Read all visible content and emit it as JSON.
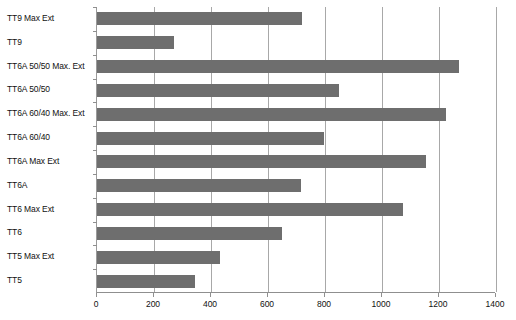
{
  "chart_data": {
    "type": "bar",
    "orientation": "horizontal",
    "title": "",
    "xlabel": "",
    "ylabel": "",
    "xlim": [
      0,
      1400
    ],
    "xticks": [
      0,
      200,
      400,
      600,
      800,
      1000,
      1200,
      1400
    ],
    "xtick_labels": [
      "0",
      "200",
      "400",
      "600",
      "800",
      "1000",
      "1200",
      "1400"
    ],
    "grid": true,
    "grid_axis": "x",
    "legend": false,
    "bar_color": "#6e6e6e",
    "categories": [
      "TT9 Max Ext",
      "TT9",
      "TT6A 50/50 Max. Ext",
      "TT6A 50/50",
      "TT6A 60/40 Max. Ext",
      "TT6A 60/40",
      "TT6A Max Ext",
      "TT6A",
      "TT6 Max Ext",
      "TT6",
      "TT5 Max Ext",
      "TT5"
    ],
    "values": [
      720,
      270,
      1270,
      850,
      1225,
      795,
      1155,
      715,
      1075,
      650,
      430,
      345
    ]
  }
}
